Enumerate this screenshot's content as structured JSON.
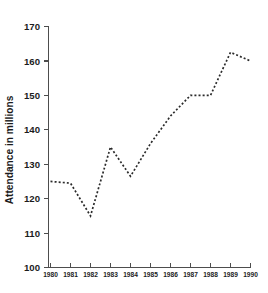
{
  "chart_data": {
    "type": "line",
    "title": "",
    "xlabel": "",
    "ylabel": "Attendance in millions",
    "categories": [
      "1980",
      "1981",
      "1982",
      "1983",
      "1984",
      "1985",
      "1986",
      "1987",
      "1988",
      "1989",
      "1990"
    ],
    "values": [
      125,
      124.5,
      115,
      135,
      126.5,
      136,
      144,
      150,
      150,
      162.5,
      160
    ],
    "series": [
      {
        "name": "Attendance",
        "values": [
          125,
          124.5,
          115,
          135,
          126.5,
          136,
          144,
          150,
          150,
          162.5,
          160
        ]
      }
    ],
    "ylim": [
      100,
      170
    ],
    "yticks": [
      100,
      110,
      120,
      130,
      140,
      150,
      160,
      170
    ],
    "ytick_labels": [
      "100",
      "110",
      "120",
      "130",
      "140",
      "150",
      "160",
      "170"
    ],
    "xticks": [
      "1980",
      "1981",
      "1982",
      "1983",
      "1984",
      "1985",
      "1986",
      "1987",
      "1988",
      "1989",
      "1990"
    ],
    "grid": false,
    "legend": false,
    "line_style": "dotted",
    "line_color": "#2b2b2b",
    "axis_color": "#4d4d4d",
    "background": "#ffffff"
  },
  "figure": {
    "cropped_title_fragment": ""
  }
}
